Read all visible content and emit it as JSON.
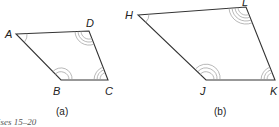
{
  "figures": [
    {
      "id": "a",
      "caption": "(a)",
      "vertices": [
        {
          "label": "A",
          "x": 16,
          "y": 34,
          "lx": 5,
          "ly": 38
        },
        {
          "label": "D",
          "x": 89,
          "y": 31,
          "lx": 86,
          "ly": 27
        },
        {
          "label": "C",
          "x": 108,
          "y": 80,
          "lx": 105,
          "ly": 95
        },
        {
          "label": "B",
          "x": 61,
          "y": 80,
          "lx": 53,
          "ly": 95
        }
      ]
    },
    {
      "id": "b",
      "caption": "(b)",
      "vertices": [
        {
          "label": "H",
          "x": 138,
          "y": 15,
          "lx": 125,
          "ly": 19
        },
        {
          "label": "L",
          "x": 246,
          "y": 7,
          "lx": 242,
          "ly": 6
        },
        {
          "label": "K",
          "x": 275,
          "y": 80,
          "lx": 270,
          "ly": 95
        },
        {
          "label": "J",
          "x": 206,
          "y": 80,
          "lx": 200,
          "ly": 95
        }
      ]
    }
  ],
  "labels": {
    "a": "(a)",
    "b": "(b)",
    "A": "A",
    "B": "B",
    "C": "C",
    "D": "D",
    "H": "H",
    "J": "J",
    "K": "K",
    "L": "L",
    "footer_caption": "ises 15–20"
  },
  "colors": {
    "edge": "#333333",
    "angle_mark": "#9a9a9a",
    "text": "#222222"
  }
}
